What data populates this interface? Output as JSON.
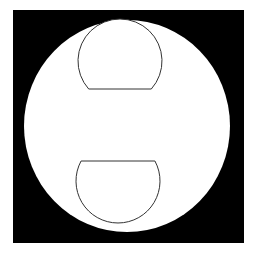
{
  "canvas": {
    "width": 254,
    "height": 261,
    "background": "#ffffff"
  },
  "colors": {
    "frame": "#000000",
    "disc": "#ffffff",
    "outline": "#333333"
  },
  "shapes": {
    "frame": {
      "x": 13,
      "y": 10,
      "width": 231,
      "height": 233
    },
    "disc": {
      "cx": 127,
      "cy": 126,
      "rx": 103,
      "ry": 106
    },
    "top_segment": {
      "orientation": "flat-bottom",
      "cx": 120,
      "cy": 61,
      "r": 42,
      "chord_y": 89
    },
    "bottom_segment": {
      "orientation": "flat-top",
      "cx": 118,
      "cy": 181,
      "r": 42,
      "chord_y": 161
    }
  }
}
